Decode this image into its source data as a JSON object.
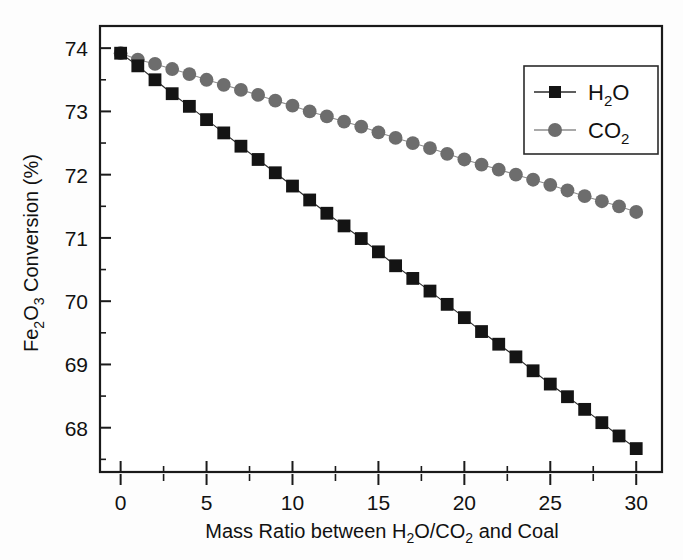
{
  "chart_data": {
    "type": "line",
    "title": "",
    "xlabel": "Mass Ratio between H2O/CO2 and Coal",
    "xlabel_parts": [
      "Mass Ratio between H",
      "2",
      "O/CO",
      "2",
      " and Coal"
    ],
    "ylabel": "Fe2O3 Conversion (%)",
    "ylabel_parts": [
      "Fe",
      "2",
      "O",
      "3",
      " Conversion (%)"
    ],
    "xlim": [
      -1.2,
      31.5
    ],
    "ylim": [
      67.3,
      74.35
    ],
    "xticks": [
      0,
      5,
      10,
      15,
      20,
      25,
      30
    ],
    "xtick_labels": [
      "0",
      "5",
      "10",
      "15",
      "20",
      "25",
      "30"
    ],
    "xtick_minor_step": 2.5,
    "yticks": [
      68,
      69,
      70,
      71,
      72,
      73,
      74
    ],
    "ytick_labels": [
      "68",
      "69",
      "70",
      "71",
      "72",
      "73",
      "74"
    ],
    "ytick_minor_step": 0.5,
    "grid": false,
    "legend_position": "upper right",
    "x": [
      0,
      1,
      2,
      3,
      4,
      5,
      6,
      7,
      8,
      9,
      10,
      11,
      12,
      13,
      14,
      15,
      16,
      17,
      18,
      19,
      20,
      21,
      22,
      23,
      24,
      25,
      26,
      27,
      28,
      29,
      30
    ],
    "series": [
      {
        "name": "H2O",
        "name_parts": [
          "H",
          "2",
          "O"
        ],
        "marker": "square",
        "color": "#141414",
        "line_color": "#2a2a2a",
        "values": [
          73.92,
          73.72,
          73.5,
          73.28,
          73.08,
          72.87,
          72.66,
          72.45,
          72.24,
          72.03,
          71.82,
          71.6,
          71.39,
          71.19,
          70.99,
          70.78,
          70.56,
          70.36,
          70.16,
          69.95,
          69.74,
          69.52,
          69.32,
          69.12,
          68.9,
          68.69,
          68.49,
          68.29,
          68.08,
          67.87,
          67.67
        ]
      },
      {
        "name": "CO2",
        "name_parts": [
          "CO",
          "2"
        ],
        "marker": "circle",
        "color": "#6d6d6d",
        "line_color": "#8c8c8c",
        "values": [
          73.92,
          73.82,
          73.75,
          73.67,
          73.59,
          73.5,
          73.42,
          73.34,
          73.26,
          73.17,
          73.09,
          73.0,
          72.92,
          72.84,
          72.76,
          72.67,
          72.58,
          72.5,
          72.42,
          72.33,
          72.24,
          72.16,
          72.08,
          72.0,
          71.92,
          71.84,
          71.75,
          71.66,
          71.58,
          71.5,
          71.41
        ]
      }
    ]
  },
  "legend": {
    "entries": [
      {
        "label": "H2O",
        "parts": [
          "H",
          "2",
          "O"
        ],
        "marker": "square-marker",
        "color": "#141414"
      },
      {
        "label": "CO2",
        "parts": [
          "CO",
          "2"
        ],
        "marker": "circle-marker",
        "color": "#6d6d6d"
      }
    ]
  }
}
